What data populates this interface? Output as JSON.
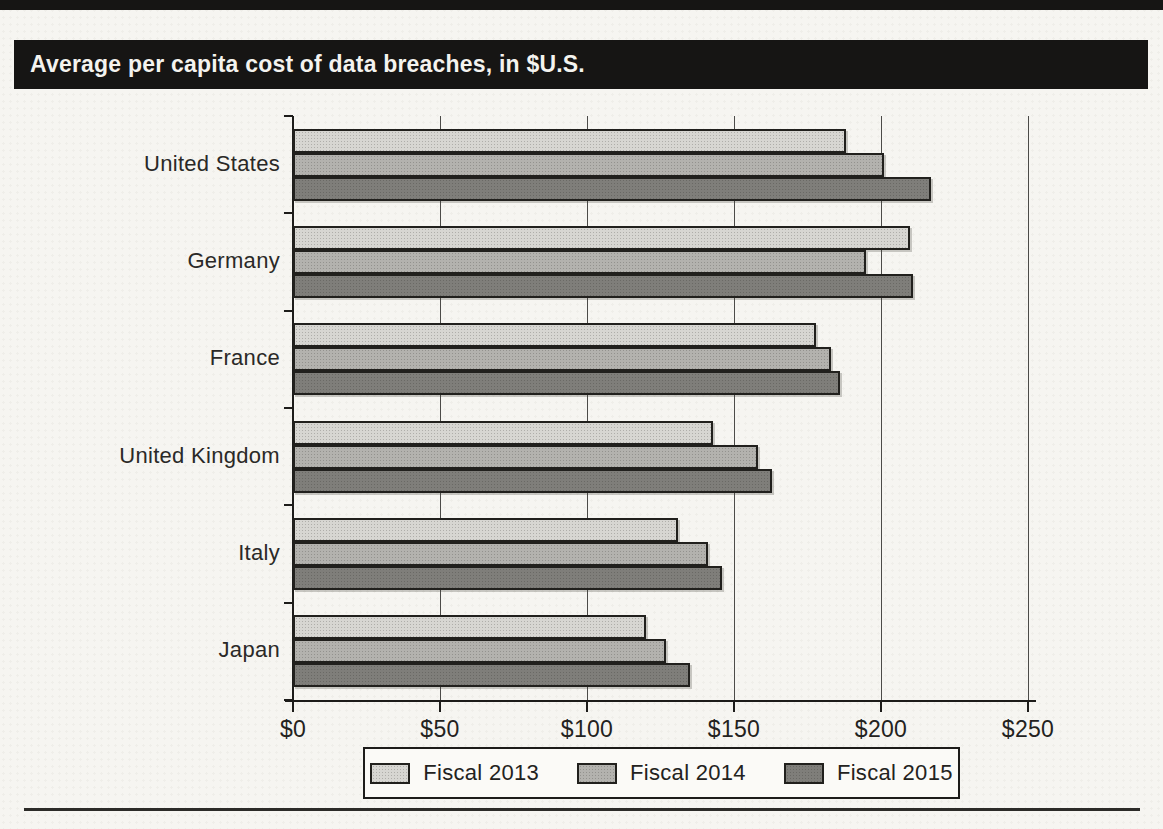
{
  "page": {
    "figure_title": "Average per capita cost of data breaches, in $U.S."
  },
  "chart_data": {
    "type": "bar",
    "orientation": "horizontal",
    "title": "Average per capita cost of data breaches, in $U.S.",
    "categories": [
      "United States",
      "Germany",
      "France",
      "United Kingdom",
      "Italy",
      "Japan"
    ],
    "series": [
      {
        "name": "Fiscal 2013",
        "color": "#d7d6d2",
        "values": [
          188,
          210,
          178,
          143,
          131,
          120
        ]
      },
      {
        "name": "Fiscal 2014",
        "color": "#b3b2ae",
        "values": [
          201,
          195,
          183,
          158,
          141,
          127
        ]
      },
      {
        "name": "Fiscal 2015",
        "color": "#7f7e7a",
        "values": [
          217,
          211,
          186,
          163,
          146,
          135
        ]
      }
    ],
    "x_axis": {
      "tick_labels": [
        "$0",
        "$50",
        "$100",
        "$150",
        "$200",
        "$250"
      ],
      "tick_values": [
        0,
        50,
        100,
        150,
        200,
        250
      ],
      "min": 0,
      "max": 250
    },
    "ylabel": "",
    "xlabel": "",
    "grid": true,
    "legend": [
      "Fiscal 2013",
      "Fiscal 2014",
      "Fiscal 2015"
    ],
    "legend_position": "bottom"
  }
}
